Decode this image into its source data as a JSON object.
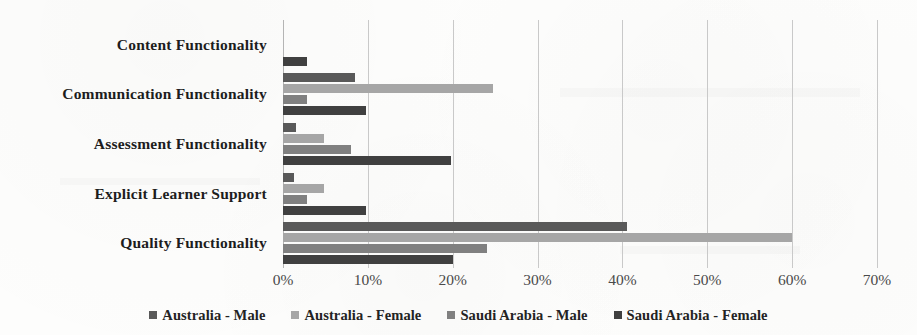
{
  "chart_data": {
    "type": "bar",
    "orientation": "horizontal",
    "title": "",
    "subtitle": "",
    "xlabel": "",
    "ylabel": "",
    "xlim": [
      0,
      70
    ],
    "x_tick_labels": [
      "0%",
      "10%",
      "20%",
      "30%",
      "40%",
      "50%",
      "60%",
      "70%"
    ],
    "x_tick_values": [
      0,
      10,
      20,
      30,
      40,
      50,
      60,
      70
    ],
    "x_unit": "%",
    "grid": true,
    "grid_axis": "x",
    "legend_position": "bottom",
    "categories": [
      "Content Functionality",
      "Communication Functionality",
      "Assessment Functionality",
      "Explicit Learner Support",
      "Quality Functionality"
    ],
    "series": [
      {
        "name": "Australia - Male",
        "color": "#595959",
        "values": [
          0,
          8.5,
          1.5,
          1.3,
          40.5
        ]
      },
      {
        "name": "Australia - Female",
        "color": "#a6a6a6",
        "values": [
          0,
          24.8,
          4.8,
          4.8,
          60.0
        ]
      },
      {
        "name": "Saudi Arabia - Male",
        "color": "#808080",
        "values": [
          0,
          2.8,
          8.0,
          2.8,
          24.0
        ]
      },
      {
        "name": "Saudi Arabia - Female",
        "color": "#404040",
        "values": [
          2.8,
          9.8,
          19.8,
          9.8,
          20.0
        ]
      }
    ]
  },
  "legend": {
    "items": [
      {
        "label": "Australia - Male",
        "color": "#595959"
      },
      {
        "label": "Australia - Female",
        "color": "#a6a6a6"
      },
      {
        "label": "Saudi Arabia - Male",
        "color": "#808080"
      },
      {
        "label": "Saudi Arabia - Female",
        "color": "#404040"
      }
    ]
  }
}
